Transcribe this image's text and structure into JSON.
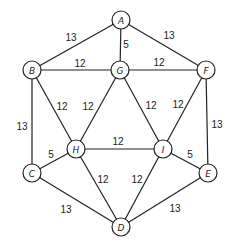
{
  "graph": {
    "nodes": [
      {
        "id": "A",
        "label": "A",
        "x": 121,
        "y": 20
      },
      {
        "id": "B",
        "label": "B",
        "x": 32,
        "y": 70
      },
      {
        "id": "G",
        "label": "G",
        "x": 120,
        "y": 70
      },
      {
        "id": "F",
        "label": "F",
        "x": 206,
        "y": 70
      },
      {
        "id": "H",
        "label": "H",
        "x": 76,
        "y": 149
      },
      {
        "id": "I",
        "label": "I",
        "x": 163,
        "y": 149
      },
      {
        "id": "C",
        "label": "C",
        "x": 32,
        "y": 173
      },
      {
        "id": "E",
        "label": "E",
        "x": 208,
        "y": 173
      },
      {
        "id": "D",
        "label": "D",
        "x": 121,
        "y": 227
      }
    ],
    "edges": [
      {
        "from": "A",
        "to": "B",
        "weight": "13",
        "lx": 71,
        "ly": 37
      },
      {
        "from": "A",
        "to": "G",
        "weight": "5",
        "lx": 126,
        "ly": 44
      },
      {
        "from": "A",
        "to": "F",
        "weight": "13",
        "lx": 169,
        "ly": 35
      },
      {
        "from": "B",
        "to": "G",
        "weight": "12",
        "lx": 80,
        "ly": 63
      },
      {
        "from": "G",
        "to": "F",
        "weight": "12",
        "lx": 159,
        "ly": 62
      },
      {
        "from": "B",
        "to": "H",
        "weight": "12",
        "lx": 62,
        "ly": 106
      },
      {
        "from": "G",
        "to": "H",
        "weight": "12",
        "lx": 88,
        "ly": 106
      },
      {
        "from": "G",
        "to": "I",
        "weight": "12",
        "lx": 151,
        "ly": 105
      },
      {
        "from": "F",
        "to": "I",
        "weight": "12",
        "lx": 178,
        "ly": 104
      },
      {
        "from": "B",
        "to": "C",
        "weight": "13",
        "lx": 22,
        "ly": 126
      },
      {
        "from": "F",
        "to": "E",
        "weight": "13",
        "lx": 217,
        "ly": 124
      },
      {
        "from": "H",
        "to": "I",
        "weight": "12",
        "lx": 118,
        "ly": 141
      },
      {
        "from": "C",
        "to": "H",
        "weight": "5",
        "lx": 51,
        "ly": 154
      },
      {
        "from": "I",
        "to": "E",
        "weight": "5",
        "lx": 190,
        "ly": 154
      },
      {
        "from": "H",
        "to": "D",
        "weight": "12",
        "lx": 103,
        "ly": 179
      },
      {
        "from": "I",
        "to": "D",
        "weight": "12",
        "lx": 137,
        "ly": 179
      },
      {
        "from": "C",
        "to": "D",
        "weight": "13",
        "lx": 66,
        "ly": 209
      },
      {
        "from": "E",
        "to": "D",
        "weight": "13",
        "lx": 175,
        "ly": 208
      }
    ]
  }
}
